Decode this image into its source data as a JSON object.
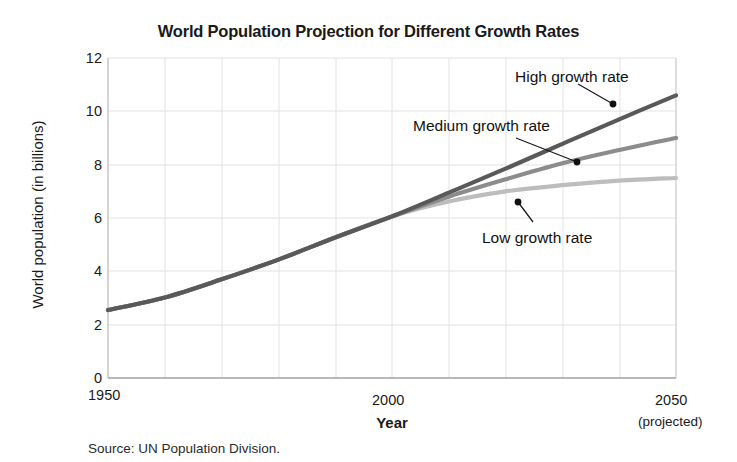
{
  "chart_data": {
    "type": "line",
    "title": "World Population Projection for Different Growth Rates",
    "xlabel": "Year",
    "ylabel": "World population (in billions)",
    "xlim": [
      1950,
      2050
    ],
    "ylim": [
      0,
      12
    ],
    "xticks": [
      "1950",
      "2000",
      "2050"
    ],
    "xtick_values": [
      1950,
      2000,
      2050
    ],
    "xtick_sublabel": "(projected)",
    "yticks": [
      "0",
      "2",
      "4",
      "6",
      "8",
      "10",
      "12"
    ],
    "ytick_values": [
      0,
      2,
      4,
      6,
      8,
      10,
      12
    ],
    "grid": true,
    "grid_x_step": 10,
    "grid_y_step": 2,
    "legend_position": "inline-annotations",
    "source": "Source: UN Population Division.",
    "x": [
      1950,
      1960,
      1970,
      1980,
      1990,
      2000,
      2010,
      2020,
      2030,
      2040,
      2050
    ],
    "series": [
      {
        "name": "High growth rate",
        "color": "#595959",
        "values": [
          2.55,
          3.02,
          3.7,
          4.44,
          5.27,
          6.06,
          6.95,
          7.85,
          8.78,
          9.7,
          10.6
        ]
      },
      {
        "name": "Medium growth rate",
        "color": "#8c8c8c",
        "values": [
          2.55,
          3.02,
          3.7,
          4.44,
          5.27,
          6.06,
          6.8,
          7.45,
          8.05,
          8.55,
          9.0
        ]
      },
      {
        "name": "Low growth rate",
        "color": "#bdbdbd",
        "values": [
          2.55,
          3.02,
          3.7,
          4.44,
          5.27,
          6.06,
          6.62,
          7.0,
          7.23,
          7.4,
          7.5
        ]
      }
    ],
    "annotations": [
      {
        "text": "High growth rate",
        "label_x": 515,
        "label_y": 68,
        "point_x": 613,
        "point_y": 104,
        "leader_from_x": 578,
        "leader_from_y": 84
      },
      {
        "text": "Medium growth rate",
        "label_x": 413,
        "label_y": 117,
        "point_x": 577,
        "point_y": 162,
        "leader_from_x": 516,
        "leader_from_y": 138
      },
      {
        "text": "Low growth rate",
        "label_x": 482,
        "label_y": 229,
        "point_x": 518,
        "point_y": 202,
        "leader_from_x": 533,
        "leader_from_y": 222
      }
    ]
  },
  "plot_geometry": {
    "left": 108,
    "right": 676,
    "top": 58,
    "bottom": 378
  }
}
